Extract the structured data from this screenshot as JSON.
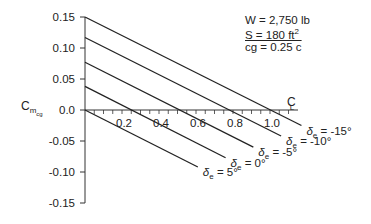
{
  "chart_data": {
    "type": "line",
    "title": "",
    "xlabel": "C_L",
    "ylabel": "C_m_cg",
    "xlim": [
      0,
      1.2
    ],
    "ylim": [
      -0.15,
      0.15
    ],
    "x_ticks": [
      "0.2",
      "0.4",
      "0.6",
      "0.8",
      "1.0"
    ],
    "y_ticks": [
      "0.15",
      "0.10",
      "0.05",
      "0.0",
      "-0.05",
      "-0.10",
      "-0.15"
    ],
    "grid": false,
    "legend_position": "inline labels at line ends",
    "annotations": [
      "W = 2,750 lb",
      "S = 180 ft²",
      "cg = 0.25 c̄"
    ],
    "series": [
      {
        "name": "δe = -15°",
        "x": [
          0,
          1.17
        ],
        "values": [
          0.15,
          -0.025
        ]
      },
      {
        "name": "δe = -10°",
        "x": [
          0,
          1.06
        ],
        "values": [
          0.117,
          -0.042
        ]
      },
      {
        "name": "δe = -5°",
        "x": [
          0,
          0.91
        ],
        "values": [
          0.077,
          -0.06
        ]
      },
      {
        "name": "δe = 0°",
        "x": [
          0,
          0.76
        ],
        "values": [
          0.038,
          -0.077
        ]
      },
      {
        "name": "δe = 5°",
        "x": [
          0,
          0.61
        ],
        "values": [
          0.0,
          -0.092
        ]
      }
    ]
  },
  "info": {
    "weight": "W = 2,750 lb",
    "area_prefix": "S = 180 ft",
    "area_sup": "2",
    "cg": "cg = 0.25 c"
  },
  "axes": {
    "y_label_main": "C",
    "y_label_sub": "m",
    "y_label_subsub": "cg",
    "x_label": "C",
    "x_label_sub": "L"
  },
  "labels": {
    "delta_symbol": "δ",
    "delta_sub": "e",
    "lines": [
      " = -15°",
      " = -10°",
      " = -5°",
      " = 0°",
      " = 5°"
    ]
  }
}
